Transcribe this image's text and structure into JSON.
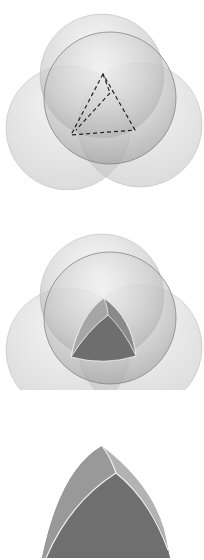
{
  "figure": {
    "panels": [
      {
        "id": "spheres-with-tetrahedron",
        "caption": ""
      },
      {
        "id": "spheres-with-reuleaux-intersection",
        "caption": ""
      },
      {
        "id": "reuleaux-tetrahedron",
        "caption": ""
      }
    ],
    "colors": {
      "background": "#ffffff",
      "sphere_light": "#e6e6e6",
      "sphere_mid": "#b5b5b5",
      "sphere_dark": "#8e8e8e",
      "face_dark": "#6f6f6f",
      "face_mid": "#8c8c8c",
      "face_light": "#a8a8a8",
      "edge": "#f2f2f2",
      "dash": "#222222"
    }
  }
}
